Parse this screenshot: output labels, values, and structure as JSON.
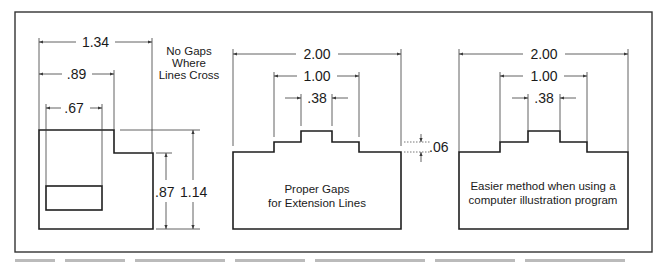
{
  "figure": {
    "panels": [
      {
        "id": "no-gaps",
        "note_lines": [
          "No Gaps",
          "Where",
          "Lines Cross"
        ],
        "horizontal_dims": [
          "1.34",
          ".89",
          ".67"
        ],
        "vertical_dims": [
          ".87",
          "1.14"
        ]
      },
      {
        "id": "proper-gaps",
        "horizontal_dims": [
          "2.00",
          "1.00",
          ".38"
        ],
        "step_dim": ".06",
        "caption_lines": [
          "Proper Gaps",
          "for Extension Lines"
        ]
      },
      {
        "id": "easier-method",
        "horizontal_dims": [
          "2.00",
          "1.00",
          ".38"
        ],
        "caption_lines": [
          "Easier method when using a",
          "computer illustration program"
        ]
      }
    ],
    "colors": {
      "line": "#1e1e1e",
      "frame": "#333333",
      "background": "#ffffff"
    }
  }
}
